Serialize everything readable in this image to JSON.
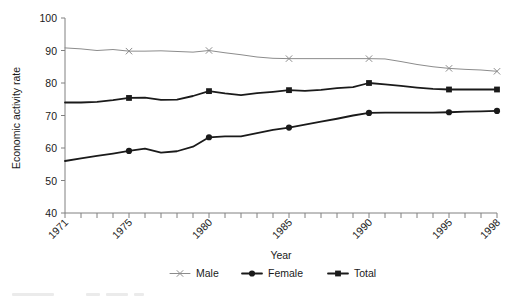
{
  "chart_data": {
    "type": "line",
    "title": "",
    "xlabel": "Year",
    "ylabel": "Economic activity rate",
    "xlim": [
      1971,
      1998
    ],
    "ylim": [
      40,
      100
    ],
    "yticks": [
      40,
      50,
      60,
      70,
      80,
      90,
      100
    ],
    "xticks_labeled": [
      1971,
      1975,
      1980,
      1985,
      1990,
      1995,
      1998
    ],
    "x": [
      1971,
      1972,
      1973,
      1974,
      1975,
      1976,
      1977,
      1978,
      1979,
      1980,
      1981,
      1982,
      1983,
      1984,
      1985,
      1986,
      1987,
      1988,
      1989,
      1990,
      1991,
      1992,
      1993,
      1994,
      1995,
      1996,
      1997,
      1998
    ],
    "grid": false,
    "legend_position": "bottom-center",
    "legend_entries": [
      "Male",
      "Female",
      "Total"
    ],
    "series": [
      {
        "name": "Male",
        "marker": "x",
        "color": "#8c8c8c",
        "marker_years": [
          1975,
          1980,
          1985,
          1990,
          1995,
          1998
        ],
        "values": [
          90.8,
          90.5,
          90.0,
          90.3,
          89.8,
          89.8,
          89.9,
          89.7,
          89.5,
          90.0,
          89.3,
          88.7,
          88.0,
          87.6,
          87.5,
          87.5,
          87.5,
          87.5,
          87.5,
          87.5,
          87.4,
          86.6,
          85.7,
          85.0,
          84.5,
          84.2,
          84.0,
          83.6
        ]
      },
      {
        "name": "Female",
        "marker": "circle",
        "color": "#1a1a1a",
        "marker_years": [
          1975,
          1980,
          1985,
          1990,
          1995,
          1998
        ],
        "values": [
          56.0,
          56.8,
          57.6,
          58.3,
          59.1,
          59.8,
          58.6,
          59.0,
          60.4,
          63.3,
          63.6,
          63.6,
          64.6,
          65.6,
          66.3,
          67.2,
          68.1,
          69.0,
          70.0,
          70.8,
          70.9,
          70.9,
          70.9,
          70.9,
          71.0,
          71.2,
          71.3,
          71.4
        ]
      },
      {
        "name": "Total",
        "marker": "square",
        "color": "#1a1a1a",
        "marker_years": [
          1975,
          1980,
          1985,
          1990,
          1995,
          1998
        ],
        "values": [
          74.0,
          74.0,
          74.2,
          74.7,
          75.4,
          75.5,
          74.8,
          74.9,
          76.0,
          77.5,
          76.8,
          76.3,
          76.9,
          77.3,
          77.8,
          77.6,
          77.9,
          78.4,
          78.7,
          80.0,
          79.6,
          79.1,
          78.6,
          78.2,
          78.0,
          78.0,
          78.0,
          78.0
        ]
      }
    ]
  }
}
